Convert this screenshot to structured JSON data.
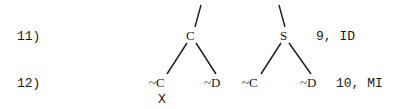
{
  "lines": [
    {
      "number": "11)",
      "justification": "9, ID"
    },
    {
      "number": "12)",
      "justification": "10, MI"
    }
  ],
  "tree": {
    "left_node": "C",
    "right_node": "S",
    "leaves": [
      "~C",
      "~D",
      "~C",
      "~D"
    ],
    "closed_marker": "X"
  }
}
